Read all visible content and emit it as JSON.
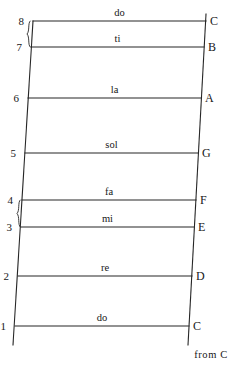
{
  "diagram": {
    "from_label": "from C",
    "stroke_color": "#262626",
    "background_color": "#ffffff",
    "rungs": [
      {
        "degree": "8",
        "syllable": "do",
        "note": "C",
        "y": 21,
        "x_left": 33,
        "x_right": 206
      },
      {
        "degree": "7",
        "syllable": "ti",
        "note": "B",
        "y": 47,
        "x_left": 31,
        "x_right": 204
      },
      {
        "degree": "6",
        "syllable": "la",
        "note": "A",
        "y": 98,
        "x_left": 28,
        "x_right": 201
      },
      {
        "degree": "5",
        "syllable": "sol",
        "note": "G",
        "y": 153,
        "x_left": 25,
        "x_right": 198
      },
      {
        "degree": "4",
        "syllable": "fa",
        "note": "F",
        "y": 200,
        "x_left": 22,
        "x_right": 196
      },
      {
        "degree": "3",
        "syllable": "mi",
        "note": "E",
        "y": 227,
        "x_left": 21,
        "x_right": 194
      },
      {
        "degree": "2",
        "syllable": "re",
        "note": "D",
        "y": 276,
        "x_left": 18,
        "x_right": 192
      },
      {
        "degree": "1",
        "syllable": "do",
        "note": "C",
        "y": 326,
        "x_left": 15,
        "x_right": 189
      }
    ],
    "half_step_braces": [
      {
        "label": "half-step-brace-7-8",
        "top_y": 21,
        "bottom_y": 47,
        "x": 27
      },
      {
        "label": "half-step-brace-3-4",
        "top_y": 200,
        "bottom_y": 227,
        "x": 17
      }
    ],
    "rails": {
      "left": {
        "x_top": 33,
        "y_top": 21,
        "x_bottom": 13,
        "y_bottom": 345
      },
      "right": {
        "x_top": 206,
        "y_top": 14,
        "x_bottom": 188,
        "y_bottom": 345
      }
    }
  }
}
